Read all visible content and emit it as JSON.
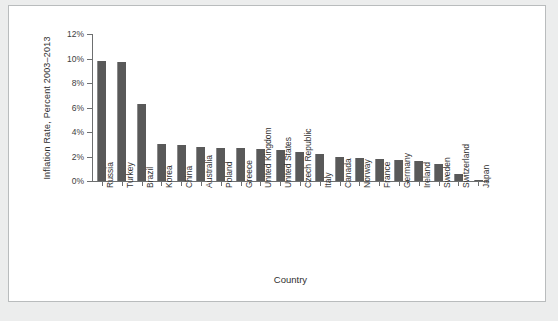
{
  "chart_data": {
    "type": "bar",
    "title": "",
    "xlabel": "Country",
    "ylabel": "Inflation Rate, Percent 2003–2013",
    "ylim": [
      0,
      12
    ],
    "ytick_labels": [
      "0%",
      "2%",
      "4%",
      "6%",
      "8%",
      "10%",
      "12%"
    ],
    "ytick_values": [
      0,
      2,
      4,
      6,
      8,
      10,
      12
    ],
    "grid": false,
    "legend": null,
    "bar_color": "#595959",
    "categories": [
      "Russia",
      "Turkey",
      "Brazil",
      "Korea",
      "China",
      "Australia",
      "Poland",
      "Greece",
      "United Kingdom",
      "United States",
      "Czech Republic",
      "Italy",
      "Canada",
      "Norway",
      "France",
      "Germany",
      "Ireland",
      "Sweden",
      "Switzerland",
      "Japan"
    ],
    "values": [
      9.8,
      9.7,
      6.3,
      3.0,
      2.9,
      2.8,
      2.7,
      2.7,
      2.6,
      2.5,
      2.4,
      2.2,
      2.0,
      1.9,
      1.8,
      1.7,
      1.6,
      1.4,
      0.6,
      0.05
    ]
  },
  "colors": {
    "page_background": "#eceded",
    "card_background": "#ffffff",
    "card_border": "#b9bcbd",
    "axis": "#6d6f70",
    "bar": "#595959",
    "text": "#333333"
  }
}
